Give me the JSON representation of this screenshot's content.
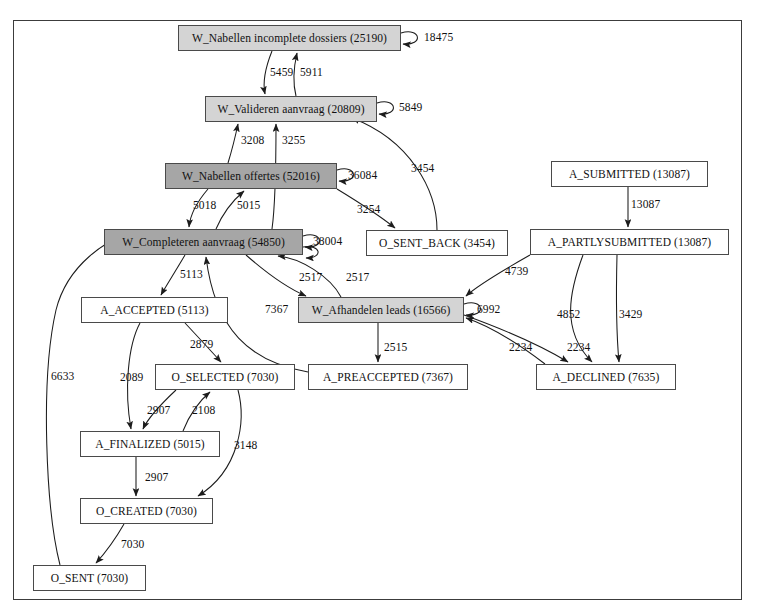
{
  "diagram": {
    "frame": {
      "x": 13,
      "y": 20,
      "width": 729,
      "height": 580
    },
    "nodes": [
      {
        "id": "w_nabellen_incomplete",
        "label": "W_Nabellen incomplete dossiers (25190)",
        "name": "W_Nabellen incomplete dossiers",
        "frequency": 25190,
        "x": 178,
        "y": 25,
        "w": 223,
        "h": 26,
        "shade": "light"
      },
      {
        "id": "w_valideren",
        "label": "W_Valideren aanvraag (20809)",
        "name": "W_Valideren aanvraag",
        "frequency": 20809,
        "x": 205,
        "y": 96,
        "w": 172,
        "h": 26,
        "shade": "light"
      },
      {
        "id": "w_nabellen_offertes",
        "label": "W_Nabellen offertes (52016)",
        "name": "W_Nabellen offertes",
        "frequency": 52016,
        "x": 165,
        "y": 163,
        "w": 172,
        "h": 26,
        "shade": "dark"
      },
      {
        "id": "a_submitted",
        "label": "A_SUBMITTED (13087)",
        "name": "A_SUBMITTED",
        "frequency": 13087,
        "x": 551,
        "y": 161,
        "w": 157,
        "h": 26,
        "shade": "white"
      },
      {
        "id": "w_completeren",
        "label": "W_Completeren aanvraag (54850)",
        "name": "W_Completeren aanvraag",
        "frequency": 54850,
        "x": 104,
        "y": 229,
        "w": 199,
        "h": 26,
        "shade": "dark"
      },
      {
        "id": "o_sent_back",
        "label": "O_SENT_BACK (3454)",
        "name": "O_SENT_BACK",
        "frequency": 3454,
        "x": 366,
        "y": 230,
        "w": 142,
        "h": 26,
        "shade": "white"
      },
      {
        "id": "a_partlysubmitted",
        "label": "A_PARTLYSUBMITTED (13087)",
        "name": "A_PARTLYSUBMITTED",
        "frequency": 13087,
        "x": 530,
        "y": 229,
        "w": 199,
        "h": 26,
        "shade": "white"
      },
      {
        "id": "a_accepted",
        "label": "A_ACCEPTED (5113)",
        "name": "A_ACCEPTED",
        "frequency": 5113,
        "x": 81,
        "y": 297,
        "w": 147,
        "h": 26,
        "shade": "white"
      },
      {
        "id": "w_afhandelen",
        "label": "W_Afhandelen leads (16566)",
        "name": "W_Afhandelen leads",
        "frequency": 16566,
        "x": 298,
        "y": 297,
        "w": 166,
        "h": 26,
        "shade": "light"
      },
      {
        "id": "o_selected",
        "label": "O_SELECTED (7030)",
        "name": "O_SELECTED",
        "frequency": 7030,
        "x": 155,
        "y": 364,
        "w": 140,
        "h": 26,
        "shade": "white"
      },
      {
        "id": "a_preaccepted",
        "label": "A_PREACCEPTED (7367)",
        "name": "A_PREACCEPTED",
        "frequency": 7367,
        "x": 308,
        "y": 364,
        "w": 160,
        "h": 26,
        "shade": "white"
      },
      {
        "id": "a_declined",
        "label": "A_DECLINED (7635)",
        "name": "A_DECLINED",
        "frequency": 7635,
        "x": 536,
        "y": 364,
        "w": 140,
        "h": 26,
        "shade": "white"
      },
      {
        "id": "a_finalized",
        "label": "A_FINALIZED (5015)",
        "name": "A_FINALIZED",
        "frequency": 5015,
        "x": 80,
        "y": 431,
        "w": 140,
        "h": 26,
        "shade": "white"
      },
      {
        "id": "o_created",
        "label": "O_CREATED (7030)",
        "name": "O_CREATED",
        "frequency": 7030,
        "x": 80,
        "y": 498,
        "w": 133,
        "h": 26,
        "shade": "white"
      },
      {
        "id": "o_sent",
        "label": "O_SENT (7030)",
        "name": "O_SENT",
        "frequency": 7030,
        "x": 33,
        "y": 565,
        "w": 113,
        "h": 26,
        "shade": "white"
      }
    ],
    "edges": [
      {
        "from": "w_nabellen_incomplete",
        "to": "w_nabellen_incomplete",
        "count": 18475,
        "label": "18475",
        "label_x": 424,
        "label_y": 31
      },
      {
        "from": "w_nabellen_incomplete",
        "to": "w_valideren",
        "count": 5459,
        "label": "5459",
        "label_x": 270,
        "label_y": 66
      },
      {
        "from": "w_valideren",
        "to": "w_nabellen_incomplete",
        "count": 5911,
        "label": "5911",
        "label_x": 300,
        "label_y": 66
      },
      {
        "from": "w_valideren",
        "to": "w_valideren",
        "count": 5849,
        "label": "5849",
        "label_x": 399,
        "label_y": 101
      },
      {
        "from": "w_nabellen_offertes",
        "to": "w_valideren",
        "count": 3208,
        "label": "3208",
        "label_x": 241,
        "label_y": 134
      },
      {
        "from": "w_completeren",
        "to": "w_valideren",
        "count": 3255,
        "label": "3255",
        "label_x": 282,
        "label_y": 134
      },
      {
        "from": "o_sent_back",
        "to": "w_valideren",
        "count": 3454,
        "label": "3454",
        "label_x": 411,
        "label_y": 162
      },
      {
        "from": "w_nabellen_offertes",
        "to": "w_nabellen_offertes",
        "count": 36084,
        "label": "36084",
        "label_x": 348,
        "label_y": 169
      },
      {
        "from": "w_nabellen_offertes",
        "to": "w_completeren",
        "count": 5018,
        "label": "5018",
        "label_x": 193,
        "label_y": 199
      },
      {
        "from": "w_completeren",
        "to": "w_nabellen_offertes",
        "count": 5015,
        "label": "5015",
        "label_x": 237,
        "label_y": 199
      },
      {
        "from": "w_nabellen_offertes",
        "to": "o_sent_back",
        "count": 3254,
        "label": "3254",
        "label_x": 357,
        "label_y": 203
      },
      {
        "from": "a_submitted",
        "to": "a_partlysubmitted",
        "count": 13087,
        "label": "13087",
        "label_x": 631,
        "label_y": 198
      },
      {
        "from": "w_completeren",
        "to": "w_completeren",
        "count": 38004,
        "label": "38004",
        "label_x": 313,
        "label_y": 235
      },
      {
        "from": "a_partlysubmitted",
        "to": "w_afhandelen",
        "count": 4739,
        "label": "4739",
        "label_x": 505,
        "label_y": 265
      },
      {
        "from": "w_completeren",
        "to": "w_afhandelen",
        "count": 2517,
        "label": "2517",
        "label_x": 299,
        "label_y": 271
      },
      {
        "from": "w_afhandelen",
        "to": "w_completeren",
        "count": 2517,
        "label": "2517",
        "label_x": 346,
        "label_y": 271
      },
      {
        "from": "w_completeren",
        "to": "a_accepted",
        "count": 5113,
        "label": "5113",
        "label_x": 180,
        "label_y": 268
      },
      {
        "from": "a_preaccepted",
        "to": "w_completeren",
        "count": 7367,
        "label": "7367",
        "label_x": 265,
        "label_y": 303
      },
      {
        "from": "w_afhandelen",
        "to": "w_afhandelen",
        "count": 6992,
        "label": "6992",
        "label_x": 477,
        "label_y": 303
      },
      {
        "from": "a_partlysubmitted",
        "to": "a_declined",
        "count": 4852,
        "label": "4852",
        "label_x": 557,
        "label_y": 308
      },
      {
        "from": "a_partlysubmitted",
        "to": "a_declined",
        "count": 3429,
        "label": "3429",
        "label_x": 619,
        "label_y": 308
      },
      {
        "from": "w_afhandelen",
        "to": "a_declined",
        "count": 2234,
        "label": "2234",
        "label_x": 509,
        "label_y": 341
      },
      {
        "from": "a_declined",
        "to": "w_afhandelen",
        "count": 2234,
        "label": "2234",
        "label_x": 567,
        "label_y": 341
      },
      {
        "from": "w_afhandelen",
        "to": "a_preaccepted",
        "count": 2515,
        "label": "2515",
        "label_x": 384,
        "label_y": 341
      },
      {
        "from": "a_accepted",
        "to": "o_selected",
        "count": 2879,
        "label": "2879",
        "label_x": 190,
        "label_y": 338
      },
      {
        "from": "a_accepted",
        "to": "a_finalized",
        "count": 2089,
        "label": "2089",
        "label_x": 120,
        "label_y": 371
      },
      {
        "from": "o_selected",
        "to": "a_finalized",
        "count": 2907,
        "label": "2907",
        "label_x": 147,
        "label_y": 404
      },
      {
        "from": "a_finalized",
        "to": "o_selected",
        "count": 2108,
        "label": "2108",
        "label_x": 192,
        "label_y": 404
      },
      {
        "from": "o_selected",
        "to": "o_created",
        "count": 3148,
        "label": "3148",
        "label_x": 234,
        "label_y": 439
      },
      {
        "from": "a_finalized",
        "to": "o_created",
        "count": 2907,
        "label": "2907",
        "label_x": 145,
        "label_y": 471
      },
      {
        "from": "o_created",
        "to": "o_sent",
        "count": 7030,
        "label": "7030",
        "label_x": 121,
        "label_y": 538
      },
      {
        "from": "o_sent",
        "to": "w_completeren",
        "count": 6633,
        "label": "6633",
        "label_x": 51,
        "label_y": 370
      }
    ]
  }
}
